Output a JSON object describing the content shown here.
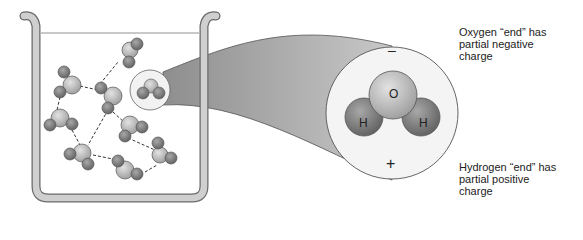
{
  "diagram": {
    "magnified_molecule": {
      "negative_symbol": "–",
      "positive_symbol": "+",
      "atoms": [
        {
          "label": "O",
          "role": "oxygen"
        },
        {
          "label": "H",
          "role": "hydrogen-left"
        },
        {
          "label": "H",
          "role": "hydrogen-right"
        }
      ]
    },
    "annotations": {
      "oxygen_end": [
        "Oxygen “end” has",
        "partial negative",
        "charge"
      ],
      "hydrogen_end": [
        "Hydrogen “end” has",
        "partial positive",
        "charge"
      ]
    },
    "colors": {
      "oxygen_fill": "#b9b9b9",
      "hydrogen_fill": "#8a8a8a",
      "beaker": "#bdbdbd",
      "zoom_cone": "#9a9a9a",
      "outline": "#555555"
    }
  }
}
